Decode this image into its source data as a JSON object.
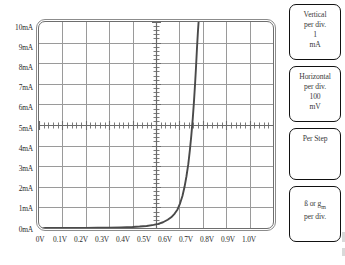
{
  "chart_data": {
    "type": "line",
    "title": "",
    "xlabel": "",
    "ylabel": "",
    "xlim": [
      0,
      1.0
    ],
    "ylim": [
      0,
      10
    ],
    "grid": true,
    "legend": false,
    "x_tick_labels": [
      "0V",
      "0.1V",
      "0.2V",
      "0.3V",
      "0.4V",
      "0.5V",
      "0.6V",
      "0.7V",
      "0.8V",
      "0.9V",
      "1.0V"
    ],
    "y_tick_labels": [
      "0mA",
      "1mA",
      "2mA",
      "3mA",
      "4mA",
      "5mA",
      "6mA",
      "7mA",
      "8mA",
      "9mA",
      "10mA"
    ],
    "x_tick_values": [
      0,
      0.1,
      0.2,
      0.3,
      0.4,
      0.5,
      0.6,
      0.7,
      0.8,
      0.9,
      1.0
    ],
    "y_tick_values": [
      0,
      1,
      2,
      3,
      4,
      5,
      6,
      7,
      8,
      9,
      10
    ],
    "divisions_x": 10,
    "divisions_y": 10,
    "center_axis_x": 0.5,
    "center_axis_y": 5,
    "series": [
      {
        "name": "diode-iv-curve",
        "color": "#4a4a4a",
        "x": [
          0.0,
          0.05,
          0.1,
          0.15,
          0.2,
          0.25,
          0.3,
          0.35,
          0.4,
          0.43,
          0.46,
          0.49,
          0.51,
          0.53,
          0.55,
          0.565,
          0.58,
          0.592,
          0.603,
          0.613,
          0.622,
          0.63,
          0.638,
          0.645,
          0.651,
          0.657,
          0.662,
          0.667,
          0.671,
          0.675,
          0.679,
          0.682
        ],
        "y": [
          0.0,
          0.0,
          0.0,
          0.0,
          0.0,
          0.01,
          0.02,
          0.03,
          0.05,
          0.07,
          0.1,
          0.15,
          0.2,
          0.28,
          0.4,
          0.52,
          0.7,
          0.9,
          1.2,
          1.55,
          2.0,
          2.5,
          3.1,
          3.8,
          4.5,
          5.3,
          6.1,
          7.0,
          7.8,
          8.7,
          9.5,
          10.0
        ]
      }
    ]
  },
  "axis": {
    "y_labels": [
      "10mA",
      "9mA",
      "8mA",
      "7mA",
      "6mA",
      "5mA",
      "4mA",
      "3mA",
      "2mA",
      "1mA",
      "0mA"
    ],
    "x_labels": [
      "0V",
      "0.1V",
      "0.2V",
      "0.3V",
      "0.4V",
      "0.5V",
      "0.6V",
      "0.7V",
      "0.8V",
      "0.9V",
      "1.0V"
    ]
  },
  "panel": {
    "vertical": {
      "title": "Vertical",
      "subtitle": "per div.",
      "value": "1",
      "unit": "mA"
    },
    "horizontal": {
      "title": "Horizontal",
      "subtitle": "per div.",
      "value": "100",
      "unit": "mV"
    },
    "per_step": {
      "title": "Per Step",
      "value": ""
    },
    "beta": {
      "title_prefix": "ß or g",
      "title_sub": "m",
      "subtitle": "per div."
    }
  },
  "colors": {
    "grid_major": "#6b6b6b",
    "grid_light": "#9a9a9a",
    "curve": "#4a4a4a",
    "frame": "#7d7d7d",
    "box_border": "#111111",
    "text": "#2a2a2a",
    "background": "#ffffff"
  }
}
